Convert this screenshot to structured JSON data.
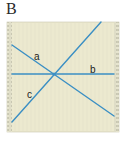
{
  "panel": {
    "label": "B"
  },
  "diagram": {
    "box": {
      "x": 7,
      "y": 22,
      "width": 112,
      "height": 110,
      "fill": "#ece9cf",
      "margin_width": 5,
      "margin_fill": "#e4e2cc",
      "margin_hatch": "#b5b3a0",
      "border": "#c9c6b0"
    },
    "line_color": "#3b8fc4",
    "intersection": {
      "x": 54,
      "y": 74
    },
    "lines": [
      {
        "id": "a",
        "label": "a",
        "x1": 12,
        "y1": 45,
        "x2": 114,
        "y2": 116,
        "label_x": 34,
        "label_y": 60
      },
      {
        "id": "b",
        "label": "b",
        "x1": 12,
        "y1": 74,
        "x2": 114,
        "y2": 74,
        "label_x": 90,
        "label_y": 73
      },
      {
        "id": "c",
        "label": "c",
        "x1": 12,
        "y1": 122,
        "x2": 101,
        "y2": 22,
        "label_x": 27,
        "label_y": 98
      }
    ],
    "label_color": "#222222"
  }
}
